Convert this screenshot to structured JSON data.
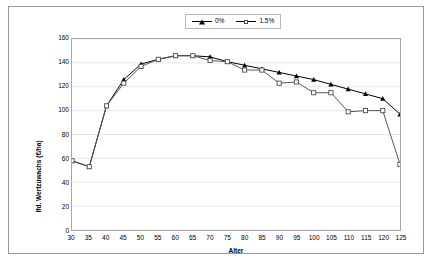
{
  "chart_data": {
    "type": "line",
    "title": "",
    "xlabel": "Alter",
    "ylabel": "lfd. Wertzuwachs (€/ha)",
    "xlim": [
      30,
      125
    ],
    "ylim": [
      0,
      160
    ],
    "ytick_step": 20,
    "xtick_step": 5,
    "grid": "horizontal",
    "legend_position": "top-center",
    "x": [
      30,
      35,
      40,
      45,
      50,
      55,
      60,
      65,
      70,
      75,
      80,
      85,
      90,
      95,
      100,
      105,
      110,
      115,
      120,
      125
    ],
    "xticklabels": [
      "30",
      "35",
      "40",
      "45",
      "50",
      "55",
      "60",
      "65",
      "70",
      "75",
      "80",
      "85",
      "90",
      "95",
      "100",
      "105",
      "110",
      "115",
      "120",
      "125"
    ],
    "yticklabels": [
      "0",
      "20",
      "40",
      "60",
      "80",
      "100",
      "120",
      "140",
      "160"
    ],
    "series": [
      {
        "name": "0%",
        "marker": "filled-triangle",
        "color": "#000000",
        "values": [
          58,
          53,
          104,
          126,
          139,
          143,
          146,
          146,
          145,
          141,
          138,
          135,
          132,
          129,
          126,
          122,
          118,
          114,
          110,
          97
        ]
      },
      {
        "name": "1.5%",
        "marker": "open-square",
        "color": "#555555",
        "values": [
          58,
          53,
          104,
          123,
          137,
          143,
          146,
          146,
          142,
          141,
          134,
          134,
          123,
          124,
          115,
          115,
          99,
          100,
          100,
          55
        ]
      }
    ]
  },
  "legend": {
    "entries": [
      {
        "label": "0%",
        "marker": "filled-triangle-icon"
      },
      {
        "label": "1.5%",
        "marker": "open-square-icon"
      }
    ]
  },
  "axes": {
    "y_title": "lfd. Wertzuwachs (€/ha)",
    "x_title": "Alter"
  }
}
